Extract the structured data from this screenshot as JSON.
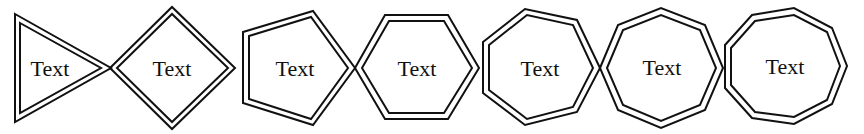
{
  "diagram": {
    "stroke_color": "#111111",
    "background": "#ffffff",
    "shapes": [
      {
        "name": "triangle",
        "sides": 3,
        "label": "Text"
      },
      {
        "name": "diamond",
        "sides": 4,
        "label": "Text"
      },
      {
        "name": "pentagon",
        "sides": 5,
        "label": "Text"
      },
      {
        "name": "hexagon",
        "sides": 6,
        "label": "Text"
      },
      {
        "name": "heptagon",
        "sides": 7,
        "label": "Text"
      },
      {
        "name": "octagon",
        "sides": 8,
        "label": "Text"
      },
      {
        "name": "nonagon",
        "sides": 9,
        "label": "Text"
      }
    ]
  }
}
